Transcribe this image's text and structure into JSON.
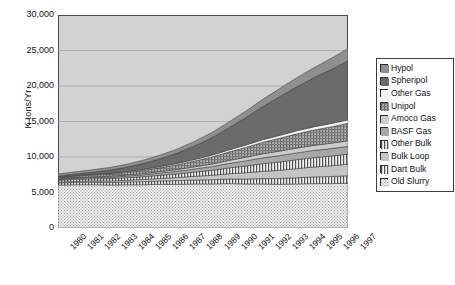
{
  "chart_data": {
    "type": "area",
    "stacked": true,
    "title": "",
    "xlabel": "",
    "ylabel": "K tons/Yr",
    "ylim": [
      0,
      30000
    ],
    "yticks": [
      0,
      5000,
      10000,
      15000,
      20000,
      25000,
      30000
    ],
    "ytick_labels": [
      "0",
      "5,000",
      "10,000",
      "15,000",
      "20,000",
      "25,000",
      "30,000"
    ],
    "grid": true,
    "legend_position": "right",
    "categories": [
      1980,
      1981,
      1982,
      1983,
      1984,
      1985,
      1986,
      1987,
      1988,
      1989,
      1990,
      1991,
      1992,
      1993,
      1994,
      1995,
      1996,
      1997
    ],
    "xtick_labels": [
      "1980",
      "1981",
      "1982",
      "1983",
      "1984",
      "1985",
      "1986",
      "1987",
      "1988",
      "1989",
      "1990",
      "1991",
      "1992",
      "1993",
      "1994",
      "1995",
      "1996",
      "1997"
    ],
    "series": [
      {
        "name": "Old Slurry",
        "pattern": "fine-dots",
        "color": "#e3e3e3",
        "values": [
          6050,
          6080,
          6100,
          6050,
          6080,
          6100,
          6150,
          6150,
          6200,
          6200,
          6250,
          6200,
          6200,
          6150,
          6200,
          6250,
          6250,
          6300
        ]
      },
      {
        "name": "Dart Bulk",
        "pattern": "vertical-stripes",
        "color": "#d9d9d9",
        "values": [
          300,
          330,
          350,
          380,
          400,
          430,
          470,
          520,
          560,
          600,
          650,
          700,
          760,
          820,
          880,
          940,
          1000,
          1060
        ]
      },
      {
        "name": "Bulk Loop",
        "pattern": "solid-light",
        "color": "#c0c0c0",
        "values": [
          120,
          150,
          180,
          200,
          240,
          300,
          360,
          430,
          520,
          620,
          740,
          880,
          1020,
          1150,
          1280,
          1400,
          1520,
          1640
        ]
      },
      {
        "name": "Other Bulk",
        "pattern": "vertical-stripes",
        "color": "#ececec",
        "values": [
          250,
          280,
          300,
          330,
          360,
          400,
          450,
          520,
          600,
          700,
          820,
          950,
          1080,
          1180,
          1260,
          1320,
          1360,
          1400
        ]
      },
      {
        "name": "BASF Gas",
        "pattern": "solid-mid",
        "color": "#a8a8a8",
        "values": [
          130,
          150,
          170,
          190,
          220,
          260,
          310,
          370,
          440,
          520,
          620,
          720,
          820,
          900,
          960,
          1010,
          1050,
          1090
        ]
      },
      {
        "name": "Amoco Gas",
        "pattern": "solid-light2",
        "color": "#c8c8c8",
        "values": [
          90,
          100,
          110,
          130,
          150,
          180,
          210,
          250,
          300,
          360,
          430,
          500,
          570,
          630,
          680,
          720,
          760,
          800
        ]
      },
      {
        "name": "Unipol",
        "pattern": "cross-hatch",
        "color": "#9a9a9a",
        "values": [
          180,
          220,
          260,
          320,
          380,
          460,
          560,
          680,
          820,
          990,
          1180,
          1400,
          1620,
          1820,
          2000,
          2160,
          2300,
          2450
        ]
      },
      {
        "name": "Other Gas",
        "pattern": "near-white",
        "color": "#f2f2f2",
        "values": [
          60,
          70,
          80,
          90,
          110,
          130,
          150,
          180,
          210,
          250,
          290,
          330,
          370,
          400,
          430,
          450,
          470,
          490
        ]
      },
      {
        "name": "Spheripol",
        "pattern": "solid-dark",
        "color": "#6b6b6b",
        "values": [
          120,
          200,
          300,
          430,
          600,
          820,
          1100,
          1450,
          1900,
          2450,
          3100,
          3850,
          4650,
          5450,
          6200,
          6900,
          7600,
          8300
        ]
      },
      {
        "name": "Hypol",
        "pattern": "solid-midgray",
        "color": "#8c8c8c",
        "values": [
          300,
          330,
          360,
          390,
          430,
          470,
          520,
          580,
          650,
          730,
          820,
          920,
          1030,
          1150,
          1280,
          1420,
          1570,
          1720
        ]
      }
    ],
    "legend_entries": [
      {
        "label": "Hypol",
        "swatch": "solid-midgray"
      },
      {
        "label": "Spheripol",
        "swatch": "solid-dark"
      },
      {
        "label": "Other Gas",
        "swatch": "near-white"
      },
      {
        "label": "Unipol",
        "swatch": "cross-hatch"
      },
      {
        "label": "Amoco Gas",
        "swatch": "solid-light2"
      },
      {
        "label": "BASF Gas",
        "swatch": "solid-mid"
      },
      {
        "label": "Other Bulk",
        "swatch": "vertical-stripes"
      },
      {
        "label": "Bulk Loop",
        "swatch": "solid-light"
      },
      {
        "label": "Dart Bulk",
        "swatch": "vertical-stripes"
      },
      {
        "label": "Old Slurry",
        "swatch": "fine-dots"
      }
    ],
    "plot_background": "#d2d2d2"
  }
}
